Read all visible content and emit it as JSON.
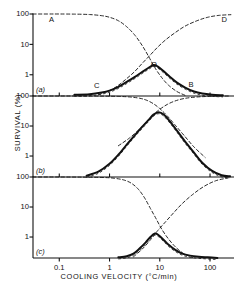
{
  "figure": {
    "xlabel": "COOLING VELOCITY (°C/min)",
    "ylabel": "SURVIVAL (%)"
  },
  "chart_data": {
    "type": "line",
    "title": "",
    "xlabel": "COOLING VELOCITY (°C/min)",
    "ylabel": "SURVIVAL (%)",
    "xscale": "log",
    "yscale": "log",
    "xlim": [
      0.03,
      300
    ],
    "xticks": [
      0.1,
      1,
      10,
      100
    ],
    "xticklabels": [
      "0.1",
      "1",
      "10",
      "100"
    ],
    "grid": false,
    "legend_position": "inline-annotations",
    "panels": [
      {
        "id": "a",
        "panel_label": "(a)",
        "ylim": [
          0.2,
          100
        ],
        "yticks": [
          1,
          10,
          100
        ],
        "yticklabels": [
          "1",
          "10",
          "100"
        ],
        "annotations": [
          {
            "text": "A",
            "x": 0.07,
            "y": 62
          },
          {
            "text": "D",
            "x": 190,
            "y": 62
          },
          {
            "text": "C",
            "x": 0.55,
            "y": 0.42
          },
          {
            "text": "B",
            "x": 42,
            "y": 0.45
          },
          {
            "text": "O",
            "x": 7.5,
            "y": 2.1
          }
        ],
        "series": [
          {
            "name": "A",
            "style": "dashed",
            "description": "fraction surviving slow-cooling solution effects",
            "x": [
              0.03,
              0.06,
              0.1,
              0.2,
              0.4,
              0.7,
              1.0,
              1.5,
              2.2,
              3.2,
              4.5,
              6.0,
              8.0,
              11,
              15,
              22,
              32
            ],
            "y": [
              100,
              100,
              100,
              99,
              96,
              88,
              78,
              60,
              38,
              20,
              9.0,
              4.0,
              1.7,
              0.8,
              0.45,
              0.28,
              0.21
            ]
          },
          {
            "name": "D",
            "style": "dashed",
            "description": "fraction surviving intracellular freezing",
            "x": [
              0.6,
              1.0,
              1.5,
              2.2,
              3.2,
              4.5,
              6.5,
              9,
              13,
              20,
              32,
              55,
              90,
              150,
              260
            ],
            "y": [
              0.22,
              0.3,
              0.45,
              0.75,
              1.3,
              2.4,
              4.5,
              8.0,
              14,
              24,
              40,
              60,
              78,
              90,
              95
            ]
          },
          {
            "name": "survival",
            "style": "solid",
            "description": "observed survival, product of A and D",
            "x": [
              0.2,
              0.4,
              0.7,
              1.0,
              1.5,
              2.2,
              3.2,
              4.5,
              6.0,
              7.5,
              9.0,
              12,
              16,
              22,
              32,
              48,
              70,
              110,
              180
            ],
            "y": [
              0.22,
              0.23,
              0.26,
              0.3,
              0.4,
              0.58,
              0.85,
              1.25,
              1.7,
              2.1,
              1.9,
              1.3,
              0.85,
              0.55,
              0.38,
              0.28,
              0.24,
              0.22,
              0.21
            ]
          }
        ]
      },
      {
        "id": "b",
        "panel_label": "(b)",
        "ylim": [
          0.2,
          100
        ],
        "yticks": [
          1,
          10,
          100
        ],
        "yticklabels": [
          "1",
          "10",
          "100"
        ],
        "annotations": [],
        "series": [
          {
            "name": "A",
            "style": "dashed",
            "description": "fraction surviving slow-cooling solution effects",
            "x": [
              0.03,
              0.1,
              0.3,
              0.8,
              1.5,
              2.5,
              4.0,
              5.5,
              7.5,
              10,
              14,
              20,
              30,
              48,
              80
            ],
            "y": [
              100,
              100,
              100,
              99,
              97,
              93,
              84,
              72,
              55,
              38,
              22,
              11,
              5.0,
              2.0,
              0.9
            ]
          },
          {
            "name": "D",
            "style": "dashed",
            "description": "fraction surviving intracellular freezing",
            "x": [
              1.5,
              2.5,
              4.0,
              5.5,
              7.5,
              10,
              14,
              20,
              30,
              48,
              80,
              140,
              250
            ],
            "y": [
              2.2,
              4.0,
              8.0,
              14,
              24,
              36,
              52,
              68,
              82,
              91,
              96,
              99,
              100
            ]
          },
          {
            "name": "survival",
            "style": "solid",
            "description": "observed survival, product of A and D",
            "x": [
              0.35,
              0.6,
              1.0,
              1.5,
              2.2,
              3.2,
              4.5,
              6.0,
              7.5,
              9.5,
              12,
              16,
              22,
              32,
              48,
              70,
              110,
              170,
              250
            ],
            "y": [
              0.22,
              0.3,
              0.55,
              1.1,
              2.4,
              5.0,
              9.5,
              16,
              24,
              29,
              24,
              14,
              7.0,
              3.0,
              1.3,
              0.6,
              0.32,
              0.23,
              0.21
            ]
          }
        ]
      },
      {
        "id": "c",
        "panel_label": "(c)",
        "ylim": [
          0.2,
          100
        ],
        "yticks": [
          1,
          10,
          100
        ],
        "yticklabels": [
          "1",
          "10",
          "100"
        ],
        "annotations": [],
        "series": [
          {
            "name": "A",
            "style": "dashed",
            "description": "fraction surviving slow-cooling solution effects",
            "x": [
              0.03,
              0.1,
              0.3,
              0.8,
              1.3,
              2.0,
              2.8,
              3.8,
              5.0,
              6.5,
              8.5,
              11,
              15,
              21,
              30,
              45
            ],
            "y": [
              100,
              100,
              99,
              96,
              90,
              78,
              60,
              38,
              20,
              9.0,
              4.0,
              1.8,
              0.85,
              0.45,
              0.28,
              0.21
            ]
          },
          {
            "name": "D",
            "style": "dashed",
            "description": "fraction surviving intracellular freezing",
            "x": [
              3.0,
              4.5,
              6.5,
              9,
              13,
              19,
              28,
              45,
              75,
              130,
              230
            ],
            "y": [
              0.22,
              0.4,
              0.8,
              1.6,
              3.2,
              6.5,
              13,
              26,
              48,
              75,
              93
            ]
          },
          {
            "name": "survival",
            "style": "solid",
            "description": "observed survival, product of A and D",
            "x": [
              1.5,
              2.2,
              3.0,
              4.0,
              5.2,
              6.5,
              8.0,
              9.5,
              12,
              15,
              20,
              28,
              40,
              60,
              90,
              140
            ],
            "y": [
              0.21,
              0.23,
              0.28,
              0.42,
              0.65,
              1.0,
              1.3,
              1.15,
              0.8,
              0.55,
              0.38,
              0.28,
              0.24,
              0.22,
              0.21,
              0.2
            ]
          }
        ]
      }
    ]
  }
}
